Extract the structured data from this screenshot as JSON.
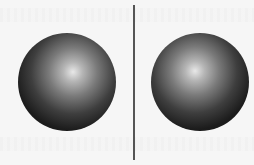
{
  "scene": {
    "background_color": "#f6f6f6",
    "divider_color": "#555555",
    "spheres": [
      {
        "label": "left-sphere",
        "center": [
          67,
          82
        ],
        "radius": 49,
        "highlight": [
          73,
          72
        ],
        "highlight_color": "#e8e8e8",
        "shadow_color": "#111111"
      },
      {
        "label": "right-sphere",
        "center": [
          200,
          82
        ],
        "radius": 49,
        "highlight": [
          195,
          71
        ],
        "highlight_color": "#e8e8e8",
        "shadow_color": "#111111"
      }
    ]
  }
}
